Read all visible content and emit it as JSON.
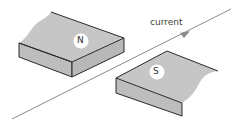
{
  "diagram": {
    "current_label": "current",
    "north_label": "N",
    "south_label": "S",
    "colors": {
      "magnet_top": "#c4c4c4",
      "magnet_side": "#b4b4b4",
      "edge": "#2a2a2a",
      "wire": "#8a8a8a",
      "pole_circle": "#ffffff"
    }
  }
}
